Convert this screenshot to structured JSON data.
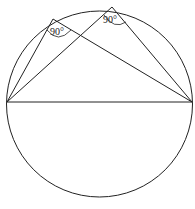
{
  "diagram": {
    "angle_labels": [
      "90°",
      "90°"
    ],
    "stroke_color": "#222222",
    "background": "#ffffff"
  }
}
